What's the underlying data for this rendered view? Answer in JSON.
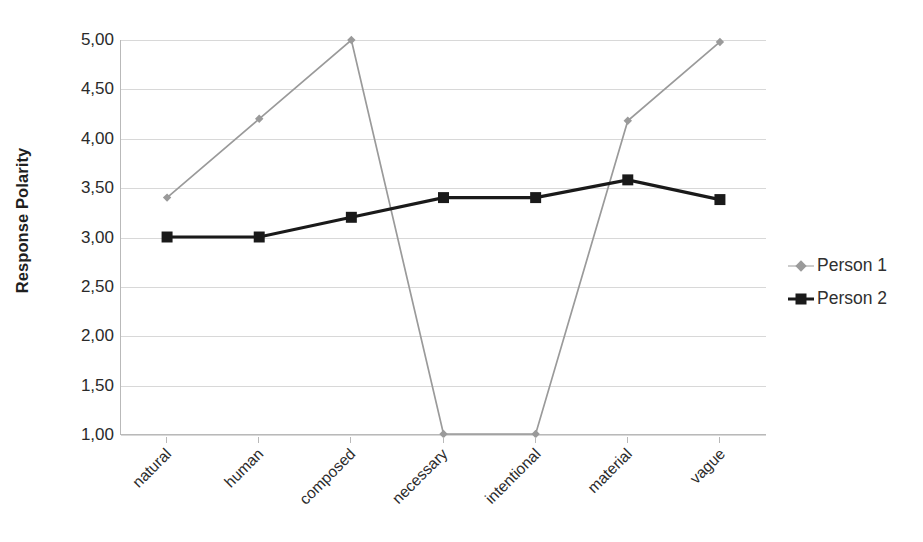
{
  "chart_data": {
    "type": "line",
    "title": "",
    "xlabel": "",
    "ylabel": "Response Polarity",
    "categories": [
      "natural",
      "human",
      "composed",
      "necessary",
      "intentional",
      "material",
      "vague"
    ],
    "ylim": [
      1.0,
      5.0
    ],
    "ytick_values": [
      1.0,
      1.5,
      2.0,
      2.5,
      3.0,
      3.5,
      4.0,
      4.5,
      5.0
    ],
    "ytick_labels": [
      "1,00",
      "1,50",
      "2,00",
      "2,50",
      "3,00",
      "3,50",
      "4,00",
      "4,50",
      "5,00"
    ],
    "grid": true,
    "legend_position": "right",
    "series": [
      {
        "name": "Person 1",
        "color": "#9a9a9a",
        "marker": "diamond",
        "values": [
          3.4,
          4.2,
          5.0,
          1.0,
          1.0,
          4.18,
          4.98
        ]
      },
      {
        "name": "Person 2",
        "color": "#1a1a1a",
        "marker": "square",
        "values": [
          3.0,
          3.0,
          3.2,
          3.4,
          3.4,
          3.58,
          3.38
        ]
      }
    ]
  },
  "axis": {
    "y_title": "Response Polarity"
  },
  "colors": {
    "person1": "#9a9a9a",
    "person2": "#1a1a1a",
    "grid": "#d8d8d8",
    "axis": "#b9b9b9"
  }
}
